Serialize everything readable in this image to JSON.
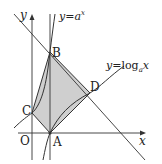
{
  "diagram": {
    "type": "function-graph",
    "axes": {
      "x_label": "x",
      "y_label": "y",
      "origin_label": "O"
    },
    "curves": [
      {
        "id": "exp",
        "label_y": "y",
        "label_eq": "=",
        "label_base": "a",
        "label_exp": "x"
      },
      {
        "id": "log",
        "label_y": "y",
        "label_eq": "=",
        "label_fn": "log",
        "label_sub": "a",
        "label_arg": "x"
      }
    ],
    "points": {
      "A": "A",
      "B": "B",
      "C": "C",
      "D": "D"
    },
    "colors": {
      "stroke": "#333333",
      "fill_region": "#cfcfcf",
      "background": "#ffffff"
    }
  }
}
